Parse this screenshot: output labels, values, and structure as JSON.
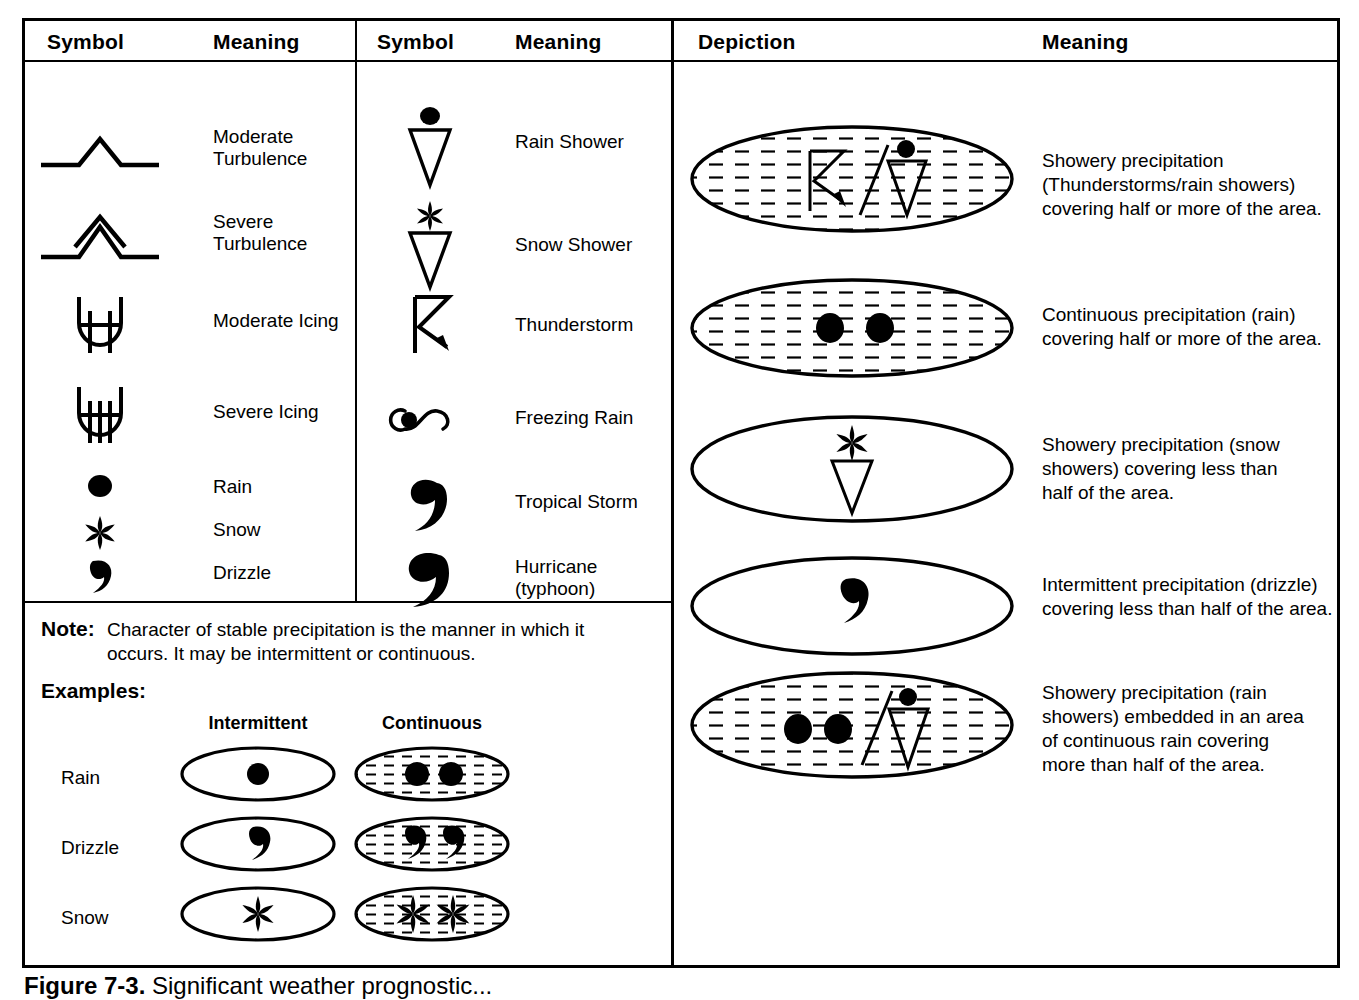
{
  "figure": {
    "caption_number": "Figure 7-3.",
    "caption_text": "Significant weather prognostic..."
  },
  "left_table": {
    "headers": {
      "symbol": "Symbol",
      "meaning": "Meaning"
    },
    "rows": [
      {
        "icon": "moderate-turbulence-icon",
        "meaning": "Moderate\nTurbulence",
        "line1": "Moderate",
        "line2": "Turbulence"
      },
      {
        "icon": "severe-turbulence-icon",
        "meaning": "Severe\nTurbulence",
        "line1": "Severe",
        "line2": "Turbulence"
      },
      {
        "icon": "moderate-icing-icon",
        "meaning": "Moderate Icing",
        "line1": "Moderate Icing",
        "line2": ""
      },
      {
        "icon": "severe-icing-icon",
        "meaning": "Severe Icing",
        "line1": "Severe Icing",
        "line2": ""
      },
      {
        "icon": "rain-dot-icon",
        "meaning": "Rain",
        "line1": "Rain",
        "line2": ""
      },
      {
        "icon": "snow-asterisk-icon",
        "meaning": "Snow",
        "line1": "Snow",
        "line2": ""
      },
      {
        "icon": "drizzle-comma-icon",
        "meaning": "Drizzle",
        "line1": "Drizzle",
        "line2": ""
      }
    ]
  },
  "middle_table": {
    "headers": {
      "symbol": "Symbol",
      "meaning": "Meaning"
    },
    "rows": [
      {
        "icon": "rain-shower-icon",
        "meaning": "Rain Shower",
        "line1": "Rain Shower",
        "line2": ""
      },
      {
        "icon": "snow-shower-icon",
        "meaning": "Snow Shower",
        "line1": "Snow Shower",
        "line2": ""
      },
      {
        "icon": "thunderstorm-icon",
        "meaning": "Thunderstorm",
        "line1": "Thunderstorm",
        "line2": ""
      },
      {
        "icon": "freezing-rain-icon",
        "meaning": "Freezing Rain",
        "line1": "Freezing Rain",
        "line2": ""
      },
      {
        "icon": "tropical-storm-icon",
        "meaning": "Tropical Storm",
        "line1": "Tropical Storm",
        "line2": ""
      },
      {
        "icon": "hurricane-icon",
        "meaning": "Hurricane (typhoon)",
        "line1": "Hurricane",
        "line2": "(typhoon)"
      }
    ]
  },
  "note": {
    "label": "Note:",
    "text": "Character of stable precipitation is the manner in which it occurs. It may be intermittent or continuous."
  },
  "examples": {
    "label": "Examples:",
    "columns": [
      "Intermittent",
      "Continuous"
    ],
    "rows": [
      {
        "label": "Rain",
        "intermittent_icon": "rain-dot-icon",
        "continuous_icon": "rain-dot-pair-hatched-icon"
      },
      {
        "label": "Drizzle",
        "intermittent_icon": "drizzle-comma-icon",
        "continuous_icon": "drizzle-comma-pair-hatched-icon"
      },
      {
        "label": "Snow",
        "intermittent_icon": "snow-asterisk-icon",
        "continuous_icon": "snow-asterisk-pair-hatched-icon"
      }
    ]
  },
  "right_table": {
    "headers": {
      "depiction": "Depiction",
      "meaning": "Meaning"
    },
    "rows": [
      {
        "depiction_icon": "hatched-ellipse-thunderstorm-rainshower-icon",
        "meaning": "Showery precipitation (Thunderstorms/rain showers) covering half or more of the area.",
        "lines": [
          "Showery precipitation",
          "(Thunderstorms/rain showers)",
          "covering half or more of the area."
        ]
      },
      {
        "depiction_icon": "hatched-ellipse-two-rain-dots-icon",
        "meaning": "Continuous precipitation (rain) covering half or more of the area.",
        "lines": [
          "Continuous precipitation (rain)",
          "covering half or more of the area."
        ]
      },
      {
        "depiction_icon": "plain-ellipse-snow-shower-icon",
        "meaning": "Showery precipitation (snow showers) covering less than half of the area.",
        "lines": [
          "Showery precipitation (snow",
          "showers) covering less than",
          "half of the area."
        ]
      },
      {
        "depiction_icon": "plain-ellipse-drizzle-icon",
        "meaning": "Intermittent precipitation (drizzle) covering less than half of the area.",
        "lines": [
          "Intermittent precipitation (drizzle)",
          "covering less than half of the area."
        ]
      },
      {
        "depiction_icon": "hatched-ellipse-rain-dots-and-rainshower-icon",
        "meaning": "Showery precipitation (rain showers) embedded in an area of continuous rain covering more than half of the area.",
        "lines": [
          "Showery precipitation (rain",
          "showers) embedded in an area",
          "of continuous rain covering",
          "more than half of the area."
        ]
      }
    ]
  },
  "colors": {
    "ink": "#000000",
    "paper": "#ffffff",
    "hatch": "#222222"
  }
}
